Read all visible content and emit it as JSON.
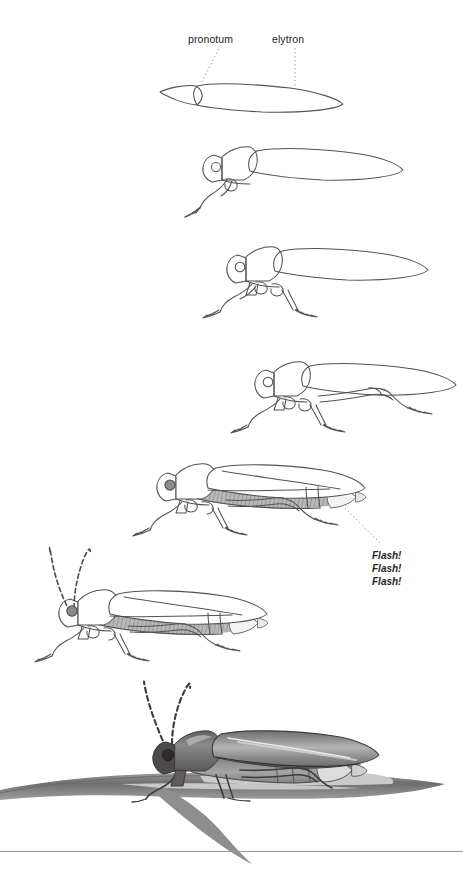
{
  "page": {
    "kind": "instructional-drawing-sequence",
    "medium": "pencil sketch",
    "step_count": 7,
    "background_color": "#ffffff",
    "ink_color": "#4a4a4a",
    "shade_color": "#8d8d8d",
    "rule_color": "#9a9a9a"
  },
  "labels": {
    "pronotum": "pronotum",
    "elytron": "elytron"
  },
  "annotations": {
    "flash_lines": [
      "Flash!",
      "Flash!",
      "Flash!"
    ]
  },
  "leaders": {
    "pronotum_leader": {
      "style": "dotted",
      "x1": 219,
      "y1": 49,
      "x2": 201,
      "y2": 83
    },
    "elytron_leader": {
      "style": "dotted",
      "x1": 295,
      "y1": 48,
      "x2": 295,
      "y2": 88
    },
    "flash_leader": {
      "style": "dotted",
      "x1": 345,
      "y1": 508,
      "x2": 381,
      "y2": 544
    }
  },
  "steps": [
    {
      "index": 1,
      "caption_parts": [
        "pronotum",
        "elytron"
      ],
      "description": "Two simple outline shapes: small pointed pronotum and long elytron",
      "features": [
        "pronotum-outline",
        "elytron-outline"
      ]
    },
    {
      "index": 2,
      "description": "Add head with eye and one foreleg",
      "features": [
        "head",
        "eye",
        "foreleg"
      ]
    },
    {
      "index": 3,
      "description": "Add second pair of legs and thorax segments",
      "features": [
        "midleg",
        "thorax-segments"
      ]
    },
    {
      "index": 4,
      "description": "Add hind legs extending back",
      "features": [
        "hindleg",
        "tarsi"
      ]
    },
    {
      "index": 5,
      "description": "Shade the abdomen and add the light organ at the tip",
      "features": [
        "abdomen-shading",
        "light-organ"
      ],
      "annotation": "Flash! Flash! Flash!"
    },
    {
      "index": 6,
      "description": "Add the long segmented antennae",
      "features": [
        "antennae"
      ]
    },
    {
      "index": 7,
      "description": "Finish with full tonal shading, highlights and a twig perch",
      "features": [
        "full-shading",
        "highlights",
        "twig"
      ]
    }
  ],
  "footer": {
    "rule": true
  }
}
